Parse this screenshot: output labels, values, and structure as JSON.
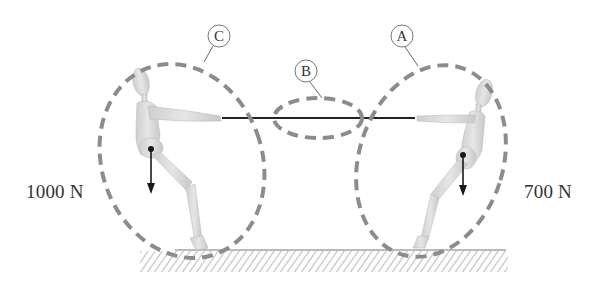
{
  "diagram": {
    "labels": {
      "A": "A",
      "B": "B",
      "C": "C"
    },
    "forces": {
      "left_weight": "1000 N",
      "right_weight": "700 N"
    },
    "regions": [
      {
        "id": "C",
        "encloses": "left person (mannequin)"
      },
      {
        "id": "B",
        "encloses": "rope"
      },
      {
        "id": "A",
        "encloses": "right person (mannequin)"
      }
    ],
    "colors": {
      "dashed_outline": "#8c8c8c",
      "rope": "#222222",
      "figure": "#d9d9d9",
      "arrow": "#1a1a1a",
      "ground_hatch": "#a0a0a0"
    }
  }
}
